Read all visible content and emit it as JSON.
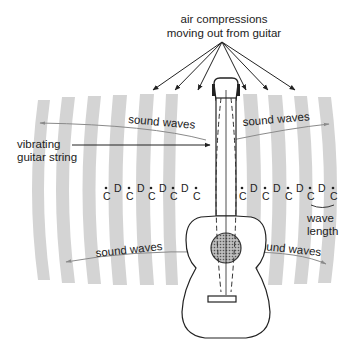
{
  "diagram": {
    "title_line1": "air compressions",
    "title_line2": "moving out from guitar",
    "labels": {
      "sound_waves_top_left": "sound waves",
      "sound_waves_top_right": "sound waves",
      "sound_waves_bottom_left": "sound waves",
      "sound_waves_bottom_right": "sound waves",
      "string_line1": "vibrating",
      "string_line2": "guitar string",
      "wavelength_line1": "wave",
      "wavelength_line2": "length"
    },
    "cd_labels": {
      "compression": "C",
      "decompression": "D"
    },
    "colors": {
      "wave_band": "#d4d4d4",
      "ink": "#222222",
      "arrow_gray": "#8a8a8a",
      "sound_hole": "#9a9a9a"
    }
  }
}
